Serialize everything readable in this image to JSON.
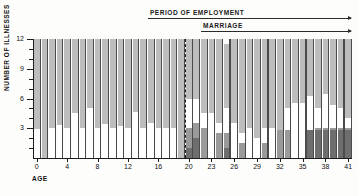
{
  "annotations": {
    "employment": {
      "label": "PERIOD OF EMPLOYMENT",
      "start_age": 15,
      "end_age": 41
    },
    "marriage": {
      "label": "MARRIAGE",
      "start_age": 22,
      "end_age": 41
    },
    "marker_age": 20
  },
  "colors": {
    "light_gray": "#bdbdbd",
    "white": "#ffffff",
    "mid_gray": "#9a9a9a",
    "dark_gray": "#6e6e6e",
    "divider": "#4b4b4b",
    "axis": "#1d1d1d",
    "background": "#fdfdfb"
  },
  "chart_data": {
    "type": "bar",
    "title": "",
    "subtitle": "",
    "xlabel": "AGE",
    "ylabel": "NUMBER OF ILLNESSES",
    "xlim": [
      0,
      41
    ],
    "ylim": [
      0,
      12
    ],
    "yticks": [
      3,
      6,
      9,
      12
    ],
    "yminor_step": 1,
    "xticks": [
      0,
      4,
      8,
      12,
      16,
      20,
      23,
      26,
      29,
      32,
      35,
      38,
      41
    ],
    "grid": false,
    "legend": "none",
    "stacked": true,
    "stack_order_bottom_to_top": [
      "dark_gray",
      "mid_gray",
      "white",
      "light_gray"
    ],
    "series": [
      {
        "name": "dark_gray",
        "values": [
          0,
          0,
          0,
          0,
          0,
          0,
          0,
          0,
          0,
          0,
          0,
          0,
          0,
          0,
          0,
          0,
          0,
          0,
          0,
          0,
          1,
          2,
          0,
          0,
          0,
          1,
          0,
          0,
          0,
          0,
          0,
          0,
          0,
          0,
          0,
          0,
          2.8,
          2.8,
          2.8,
          2.8,
          2.8,
          2.8
        ]
      },
      {
        "name": "mid_gray",
        "values": [
          0,
          0,
          0,
          0,
          0,
          0,
          0,
          0,
          0,
          0,
          0,
          0,
          0,
          0,
          0,
          0,
          0,
          0,
          0,
          0,
          2,
          1.5,
          3,
          0,
          2.5,
          1.5,
          0,
          1.5,
          0,
          0,
          1.5,
          0,
          2.8,
          2.8,
          0,
          0,
          0,
          0.2,
          0.2,
          0.2,
          0.2,
          0.2
        ]
      },
      {
        "name": "white",
        "values": [
          2.9,
          0,
          3,
          3.3,
          3,
          4.5,
          3,
          5,
          3,
          3.4,
          3,
          3.2,
          3,
          4.6,
          3,
          3.5,
          3,
          3,
          3,
          0,
          3,
          2.5,
          1.5,
          4.5,
          1,
          2.5,
          3.5,
          1,
          3,
          2,
          1.5,
          3,
          0,
          2.2,
          5.5,
          5.5,
          3.5,
          2,
          3.5,
          2.3,
          2,
          1
        ]
      },
      {
        "name": "light_gray",
        "values": [
          9.1,
          12,
          9,
          8.7,
          9,
          7.5,
          9,
          7,
          9,
          8.6,
          9,
          8.8,
          9,
          7.4,
          9,
          8.5,
          9,
          9,
          9,
          12,
          6,
          6,
          7.5,
          7.5,
          8.5,
          6.5,
          8.5,
          9.5,
          9,
          10,
          9,
          9,
          9.2,
          7,
          6.5,
          6.5,
          5.7,
          7,
          5.5,
          6.7,
          7,
          8
        ]
      }
    ]
  }
}
